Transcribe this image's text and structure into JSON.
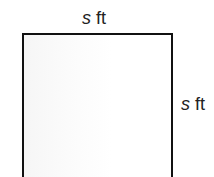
{
  "diagram": {
    "shape": "square",
    "top_label": {
      "variable": "s",
      "unit": "ft"
    },
    "right_label": {
      "variable": "s",
      "unit": "ft"
    },
    "colors": {
      "stroke": "#111111",
      "fill": "#ffffff",
      "text": "#222222"
    }
  }
}
